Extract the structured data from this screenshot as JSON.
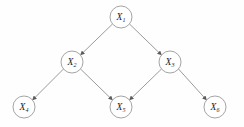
{
  "figure": {
    "type": "directed-acyclic-graph",
    "title": "",
    "background_color": "#fefefe",
    "node_stroke_color": "#9a9a9a",
    "edge_color": "#8f8f8f",
    "arrow_color": "#5a5a5a",
    "label_color": "#1a1a1a",
    "node_radius": 11
  },
  "nodes": [
    {
      "id": "X1",
      "base": "X",
      "sub": "1",
      "cx": 121,
      "cy": 17
    },
    {
      "id": "X2",
      "base": "X",
      "sub": "2",
      "cx": 72,
      "cy": 62
    },
    {
      "id": "X3",
      "base": "X",
      "sub": "3",
      "cx": 170,
      "cy": 62
    },
    {
      "id": "X4",
      "base": "X",
      "sub": "4",
      "cx": 24,
      "cy": 107
    },
    {
      "id": "X5",
      "base": "X",
      "sub": "5",
      "cx": 121,
      "cy": 107
    },
    {
      "id": "X6",
      "base": "X",
      "sub": "6",
      "cx": 215,
      "cy": 107
    }
  ],
  "edges": [
    {
      "id": "e1",
      "from": "X1",
      "to": "X2",
      "x1": 112.5,
      "y1": 24.0,
      "x2": 80.5,
      "y2": 55.0
    },
    {
      "id": "e2",
      "from": "X1",
      "to": "X3",
      "x1": 129.5,
      "y1": 24.0,
      "x2": 161.5,
      "y2": 55.0
    },
    {
      "id": "e3",
      "from": "X2",
      "to": "X4",
      "x1": 63.5,
      "y1": 69.0,
      "x2": 32.5,
      "y2": 100.0
    },
    {
      "id": "e4",
      "from": "X2",
      "to": "X5",
      "x1": 80.5,
      "y1": 69.0,
      "x2": 112.5,
      "y2": 100.0
    },
    {
      "id": "e5",
      "from": "X3",
      "to": "X5",
      "x1": 161.5,
      "y1": 69.0,
      "x2": 129.5,
      "y2": 100.0
    },
    {
      "id": "e6",
      "from": "X3",
      "to": "X6",
      "x1": 178.5,
      "y1": 69.0,
      "x2": 206.5,
      "y2": 100.0
    }
  ]
}
